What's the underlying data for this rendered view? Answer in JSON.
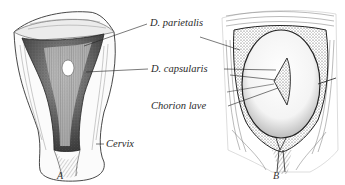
{
  "figure": {
    "panels": [
      {
        "id": "A",
        "letter": "A",
        "subject": "uterus-opened-frontal-view"
      },
      {
        "id": "B",
        "letter": "B",
        "subject": "uterus-with-gestational-sac"
      }
    ],
    "labels": {
      "parietalis": "D. parietalis",
      "capsularis": "D. capsularis",
      "chorion": "Chorion lave",
      "cervix": "Cervix"
    },
    "colors": {
      "ink": "#222222",
      "paper": "#ffffff",
      "shade": "#555555"
    }
  }
}
